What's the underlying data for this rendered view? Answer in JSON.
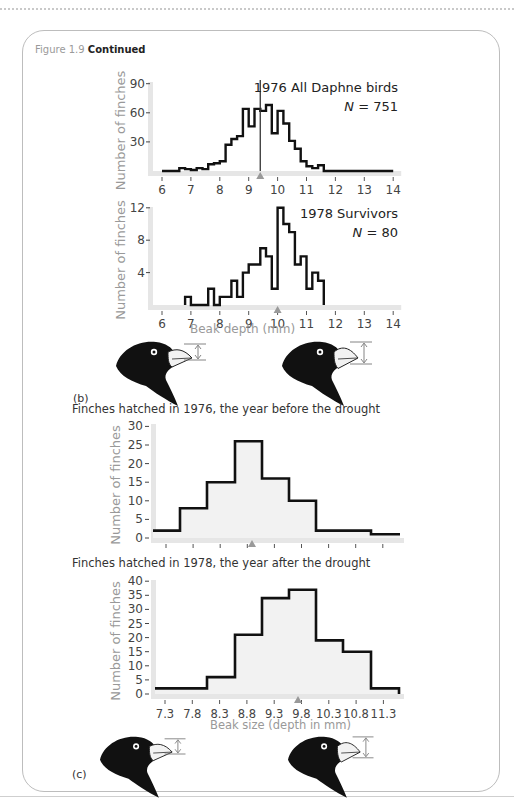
{
  "figure": {
    "number": "Figure 1.9",
    "status": "Continued"
  },
  "panel_b": {
    "label": "(b)",
    "xlabel": "Beak depth (mm)"
  },
  "panel_c": {
    "label": "(c)",
    "subtitle_1976": "Finches hatched in 1976, the year before the drought",
    "subtitle_1978": "Finches hatched in 1978, the year after the drought",
    "xlabel": "Beak size (depth in mm)"
  },
  "colors": {
    "line": "#111111",
    "axis": "#e6e6e6",
    "fill": "#f2f2f2",
    "text_gray": "#999999",
    "marker": "#999999"
  },
  "chart_data": [
    {
      "type": "bar",
      "title": "1976 All Daphne birds",
      "annotation": "N = 751",
      "n_label": "N",
      "n_value": "751",
      "xlabel": "",
      "ylabel": "Number of finches",
      "x_ticks": [
        "6",
        "7",
        "8",
        "9",
        "10",
        "11",
        "12",
        "13",
        "14"
      ],
      "y_ticks": [
        "30",
        "60",
        "90"
      ],
      "xlim": [
        6,
        14
      ],
      "ylim": [
        0,
        90
      ],
      "mean_marker": 9.4,
      "bin_width": 0.2,
      "bin_starts": [
        6.0,
        6.2,
        6.4,
        6.6,
        6.8,
        7.0,
        7.2,
        7.4,
        7.6,
        7.8,
        8.0,
        8.2,
        8.4,
        8.6,
        8.8,
        9.0,
        9.2,
        9.4,
        9.6,
        9.8,
        10.0,
        10.2,
        10.4,
        10.6,
        10.8,
        11.0,
        11.2,
        11.4,
        11.6,
        11.8,
        12.0,
        12.2,
        12.4,
        12.6,
        12.8,
        13.0,
        13.2,
        13.4,
        13.6,
        13.8
      ],
      "values": [
        0,
        0,
        0,
        3,
        2,
        1,
        3,
        2,
        7,
        8,
        10,
        27,
        33,
        36,
        64,
        46,
        64,
        62,
        68,
        39,
        62,
        49,
        31,
        23,
        10,
        5,
        3,
        6,
        0,
        0,
        0,
        0,
        0,
        0,
        0,
        0,
        0,
        0,
        0,
        0
      ]
    },
    {
      "type": "bar",
      "title": "1978 Survivors",
      "annotation": "N = 80",
      "n_label": "N",
      "n_value": "80",
      "xlabel": "Beak depth (mm)",
      "ylabel": "Number of finches",
      "x_ticks": [
        "6",
        "7",
        "8",
        "9",
        "10",
        "11",
        "12",
        "13",
        "14"
      ],
      "y_ticks": [
        "4",
        "8",
        "12"
      ],
      "xlim": [
        6,
        14
      ],
      "ylim": [
        0,
        12
      ],
      "mean_marker": 10.0,
      "bin_width": 0.2,
      "bin_starts": [
        6.8,
        7.0,
        7.2,
        7.4,
        7.6,
        7.8,
        8.0,
        8.2,
        8.4,
        8.6,
        8.8,
        9.0,
        9.2,
        9.4,
        9.6,
        9.8,
        10.0,
        10.2,
        10.4,
        10.6,
        10.8,
        11.0,
        11.2,
        11.4
      ],
      "values": [
        1,
        0,
        0,
        0,
        2,
        0,
        1,
        1,
        3,
        1,
        4,
        5,
        5,
        7,
        6,
        2,
        12,
        10,
        9,
        5,
        6,
        2,
        4,
        3
      ]
    },
    {
      "type": "bar",
      "title": "Finches hatched in 1976, the year before the drought",
      "xlabel": "",
      "ylabel": "Number of finches",
      "y_ticks": [
        "0",
        "5",
        "10",
        "15",
        "20",
        "25",
        "30"
      ],
      "ylim": [
        0,
        30
      ],
      "x_ticks": [],
      "mean_marker_index": 3.2,
      "values": [
        2,
        8,
        15,
        26,
        16,
        10,
        2,
        2,
        1
      ]
    },
    {
      "type": "bar",
      "title": "Finches hatched in 1978, the year after the drought",
      "xlabel": "Beak size (depth in mm)",
      "ylabel": "Number of finches",
      "x_ticks": [
        "7.3",
        "7.8",
        "8.3",
        "8.8",
        "9.3",
        "9.8",
        "10.3",
        "10.8",
        "11.3"
      ],
      "y_ticks": [
        "0",
        "5",
        "10",
        "15",
        "20",
        "25",
        "30",
        "35",
        "40"
      ],
      "ylim": [
        0,
        40
      ],
      "mean_marker": 9.75,
      "values": [
        2,
        2,
        6,
        21,
        34,
        37,
        19,
        15,
        2
      ]
    }
  ]
}
